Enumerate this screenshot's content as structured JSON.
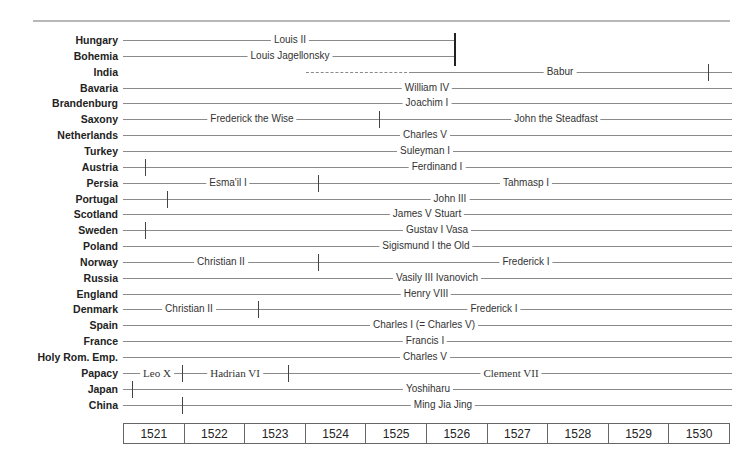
{
  "chart_data": {
    "type": "timeline",
    "title": "",
    "x_axis": {
      "years": [
        "1521",
        "1522",
        "1523",
        "1524",
        "1525",
        "1526",
        "1527",
        "1528",
        "1529",
        "1530"
      ]
    },
    "rows": [
      {
        "country": "Hungary",
        "segments": [
          {
            "ruler": "Louis II",
            "end": "1526 (ends)"
          }
        ]
      },
      {
        "country": "Bohemia",
        "segments": [
          {
            "ruler": "Louis Jagellonsky",
            "end": "1526 (ends)"
          }
        ]
      },
      {
        "country": "India",
        "segments": [
          {
            "ruler": "Babur",
            "start": "~1524 (dashed to ~1526)",
            "tick": "~1530"
          }
        ]
      },
      {
        "country": "Bavaria",
        "segments": [
          {
            "ruler": "William IV"
          }
        ]
      },
      {
        "country": "Brandenburg",
        "segments": [
          {
            "ruler": "Joachim I"
          }
        ]
      },
      {
        "country": "Saxony",
        "segments": [
          {
            "ruler": "Frederick the Wise"
          },
          {
            "ruler": "John the Steadfast"
          }
        ],
        "ticks": [
          "~1525"
        ]
      },
      {
        "country": "Netherlands",
        "segments": [
          {
            "ruler": "Charles V"
          }
        ]
      },
      {
        "country": "Turkey",
        "segments": [
          {
            "ruler": "Suleyman I"
          }
        ]
      },
      {
        "country": "Austria",
        "segments": [
          {
            "ruler": "Ferdinand I"
          }
        ],
        "ticks": [
          "~1521"
        ]
      },
      {
        "country": "Persia",
        "segments": [
          {
            "ruler": "Esma'il I"
          },
          {
            "ruler": "Tahmasp I"
          }
        ],
        "ticks": [
          "~1524"
        ]
      },
      {
        "country": "Portugal",
        "segments": [
          {
            "ruler": "John III"
          }
        ],
        "ticks": [
          "~1521"
        ]
      },
      {
        "country": "Scotland",
        "segments": [
          {
            "ruler": "James V Stuart"
          }
        ]
      },
      {
        "country": "Sweden",
        "segments": [
          {
            "ruler": "Gustav I Vasa"
          }
        ],
        "ticks": [
          "~1521"
        ]
      },
      {
        "country": "Poland",
        "segments": [
          {
            "ruler": "Sigismund I the Old"
          }
        ]
      },
      {
        "country": "Norway",
        "segments": [
          {
            "ruler": "Christian II"
          },
          {
            "ruler": "Frederick I"
          }
        ],
        "ticks": [
          "~1524"
        ]
      },
      {
        "country": "Russia",
        "segments": [
          {
            "ruler": "Vasily III Ivanovich"
          }
        ]
      },
      {
        "country": "England",
        "segments": [
          {
            "ruler": "Henry VIII"
          }
        ]
      },
      {
        "country": "Denmark",
        "segments": [
          {
            "ruler": "Christian II"
          },
          {
            "ruler": "Frederick I"
          }
        ],
        "ticks": [
          "~1523"
        ]
      },
      {
        "country": "Spain",
        "segments": [
          {
            "ruler": "Charles I (= Charles V)"
          }
        ]
      },
      {
        "country": "France",
        "segments": [
          {
            "ruler": "Francis I"
          }
        ]
      },
      {
        "country": "Holy Rom. Emp.",
        "segments": [
          {
            "ruler": "Charles V"
          }
        ]
      },
      {
        "country": "Papacy",
        "segments": [
          {
            "ruler": "Leo X"
          },
          {
            "ruler": "Hadrian VI"
          },
          {
            "ruler": "Clement VII"
          }
        ],
        "ticks": [
          "~1522",
          "~1523"
        ]
      },
      {
        "country": "Japan",
        "segments": [
          {
            "ruler": "Yoshiharu"
          }
        ],
        "ticks": [
          "~1521"
        ]
      },
      {
        "country": "China",
        "segments": [
          {
            "ruler": "Ming Jia Jing"
          }
        ],
        "ticks": [
          "~1522"
        ]
      }
    ]
  },
  "rows": [
    {
      "country": "Hungary",
      "labels": [
        {
          "text": "Louis II",
          "x": 290
        }
      ],
      "line": [
        123,
        455
      ],
      "ticks": []
    },
    {
      "country": "Bohemia",
      "labels": [
        {
          "text": "Louis Jagellonsky",
          "x": 290
        }
      ],
      "line": [
        123,
        455
      ],
      "ticks": []
    },
    {
      "country": "India",
      "labels": [
        {
          "text": "Babur",
          "x": 560
        }
      ],
      "dashed": [
        306,
        412
      ],
      "line": [
        412,
        732
      ],
      "ticks": [
        708
      ]
    },
    {
      "country": "Bavaria",
      "labels": [
        {
          "text": "William IV",
          "x": 427
        }
      ],
      "line": [
        123,
        732
      ],
      "ticks": []
    },
    {
      "country": "Brandenburg",
      "labels": [
        {
          "text": "Joachim I",
          "x": 427
        }
      ],
      "line": [
        123,
        732
      ],
      "ticks": []
    },
    {
      "country": "Saxony",
      "labels": [
        {
          "text": "Frederick the Wise",
          "x": 252
        },
        {
          "text": "John the Steadfast",
          "x": 556
        }
      ],
      "line": [
        123,
        732
      ],
      "ticks": [
        379
      ]
    },
    {
      "country": "Netherlands",
      "labels": [
        {
          "text": "Charles V",
          "x": 425
        }
      ],
      "line": [
        123,
        732
      ],
      "ticks": []
    },
    {
      "country": "Turkey",
      "labels": [
        {
          "text": "Suleyman I",
          "x": 425
        }
      ],
      "line": [
        123,
        732
      ],
      "ticks": []
    },
    {
      "country": "Austria",
      "labels": [
        {
          "text": "Ferdinand I",
          "x": 437
        }
      ],
      "line": [
        123,
        732
      ],
      "ticks": [
        145
      ]
    },
    {
      "country": "Persia",
      "labels": [
        {
          "text": "Esma'il I",
          "x": 228
        },
        {
          "text": "Tahmasp I",
          "x": 526
        }
      ],
      "line": [
        123,
        732
      ],
      "ticks": [
        318
      ]
    },
    {
      "country": "Portugal",
      "labels": [
        {
          "text": "John III",
          "x": 450
        }
      ],
      "line": [
        123,
        732
      ],
      "ticks": [
        167
      ]
    },
    {
      "country": "Scotland",
      "labels": [
        {
          "text": "James V Stuart",
          "x": 427
        }
      ],
      "line": [
        123,
        732
      ],
      "ticks": []
    },
    {
      "country": "Sweden",
      "labels": [
        {
          "text": "Gustav I Vasa",
          "x": 437
        }
      ],
      "line": [
        123,
        732
      ],
      "ticks": [
        145
      ]
    },
    {
      "country": "Poland",
      "labels": [
        {
          "text": "Sigismund I the Old",
          "x": 426
        }
      ],
      "line": [
        123,
        732
      ],
      "ticks": []
    },
    {
      "country": "Norway",
      "labels": [
        {
          "text": "Christian II",
          "x": 221
        },
        {
          "text": "Frederick I",
          "x": 526
        }
      ],
      "line": [
        123,
        732
      ],
      "ticks": [
        318
      ]
    },
    {
      "country": "Russia",
      "labels": [
        {
          "text": "Vasily III Ivanovich",
          "x": 437
        }
      ],
      "line": [
        123,
        732
      ],
      "ticks": []
    },
    {
      "country": "England",
      "labels": [
        {
          "text": "Henry VIII",
          "x": 426
        }
      ],
      "line": [
        123,
        732
      ],
      "ticks": []
    },
    {
      "country": "Denmark",
      "labels": [
        {
          "text": "Christian II",
          "x": 189
        },
        {
          "text": "Frederick I",
          "x": 494
        }
      ],
      "line": [
        123,
        732
      ],
      "ticks": [
        258
      ]
    },
    {
      "country": "Spain",
      "labels": [
        {
          "text": "Charles I (= Charles V)",
          "x": 424
        }
      ],
      "line": [
        123,
        732
      ],
      "ticks": []
    },
    {
      "country": "France",
      "labels": [
        {
          "text": "Francis I",
          "x": 425
        }
      ],
      "line": [
        123,
        732
      ],
      "ticks": []
    },
    {
      "country": "Holy Rom. Emp.",
      "labels": [
        {
          "text": "Charles V",
          "x": 425
        }
      ],
      "line": [
        123,
        732
      ],
      "ticks": []
    },
    {
      "country": "Papacy",
      "labels": [
        {
          "text": "Leo  X",
          "x": 157,
          "serif": true
        },
        {
          "text": "Hadrian VI",
          "x": 235,
          "serif": true
        },
        {
          "text": "Clement VII",
          "x": 511,
          "serif": true
        }
      ],
      "line": [
        123,
        732
      ],
      "ticks": [
        182,
        288
      ]
    },
    {
      "country": "Japan",
      "labels": [
        {
          "text": "Yoshiharu",
          "x": 428
        }
      ],
      "line": [
        123,
        732
      ],
      "ticks": [
        132
      ]
    },
    {
      "country": "China",
      "labels": [
        {
          "text": "Ming Jia Jing",
          "x": 443
        }
      ],
      "line": [
        123,
        732
      ],
      "ticks": [
        182
      ]
    }
  ],
  "years": [
    "1521",
    "1522",
    "1523",
    "1524",
    "1525",
    "1526",
    "1527",
    "1528",
    "1529",
    "1530"
  ]
}
